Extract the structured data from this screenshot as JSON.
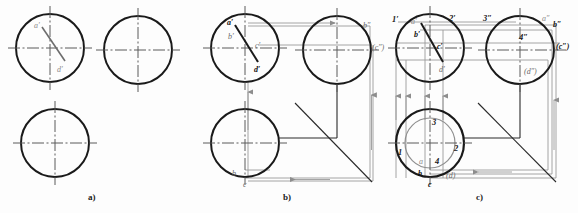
{
  "figure": {
    "background_color": "#fdfdfd",
    "outline_color": "#1a1a1a",
    "center_line_color": "#5a5a5a",
    "projection_line_color": "#9a9a9a",
    "chord_color": "#555555",
    "captions": [
      {
        "id": "a",
        "text": "a)",
        "x": 88,
        "y": 192
      },
      {
        "id": "b",
        "text": "b)",
        "x": 283,
        "y": 192
      },
      {
        "id": "c",
        "text": "c)",
        "x": 476,
        "y": 192
      }
    ]
  },
  "panel_a": {
    "name": "panel-a",
    "caption": "a)",
    "circles": [
      {
        "name": "front-view-circle",
        "cx": 50,
        "cy": 48,
        "r": 34
      },
      {
        "name": "side-view-circle",
        "cx": 138,
        "cy": 50,
        "r": 34
      },
      {
        "name": "top-view-circle",
        "cx": 55,
        "cy": 143,
        "r": 34
      }
    ],
    "labels": [
      {
        "name": "label-a-prime",
        "text": "a′",
        "x": 34,
        "y": 22
      },
      {
        "name": "label-d-prime",
        "text": "d′",
        "x": 57,
        "y": 66
      }
    ],
    "chord": {
      "name": "chord-ad",
      "x1": 42,
      "y1": 27,
      "x2": 65,
      "y2": 61
    }
  },
  "panel_b": {
    "name": "panel-b",
    "caption": "b)",
    "circles": [
      {
        "name": "front-view-circle",
        "cx": 245,
        "cy": 48,
        "r": 34
      },
      {
        "name": "side-view-circle",
        "cx": 337,
        "cy": 50,
        "r": 34
      },
      {
        "name": "top-view-circle",
        "cx": 245,
        "cy": 143,
        "r": 34
      }
    ],
    "labels": [
      {
        "name": "label-a-prime",
        "text": "a′",
        "x": 227,
        "y": 19
      },
      {
        "name": "label-b-prime",
        "text": "b′",
        "x": 228,
        "y": 33
      },
      {
        "name": "label-c-prime",
        "text": "c′",
        "x": 255,
        "y": 42
      },
      {
        "name": "label-d-prime",
        "text": "d′",
        "x": 254,
        "y": 66
      },
      {
        "name": "label-b-double-prime",
        "text": "b″",
        "x": 363,
        "y": 22
      },
      {
        "name": "label-c-double-prime",
        "text": "(c″)",
        "x": 372,
        "y": 44
      },
      {
        "name": "label-b-top",
        "text": "b",
        "x": 232,
        "y": 170
      },
      {
        "name": "label-c-top",
        "text": "c",
        "x": 243,
        "y": 181
      }
    ],
    "chord": {
      "name": "chord-ad",
      "x1": 235,
      "y1": 25,
      "x2": 258,
      "y2": 62
    },
    "miter_line": {
      "name": "miter-line-45",
      "x1": 295,
      "y1": 103,
      "x2": 372,
      "y2": 182
    }
  },
  "panel_c": {
    "name": "panel-c",
    "caption": "c)",
    "circles": [
      {
        "name": "front-view-circle",
        "cx": 430,
        "cy": 48,
        "r": 34
      },
      {
        "name": "side-view-circle",
        "cx": 520,
        "cy": 50,
        "r": 34
      },
      {
        "name": "top-view-circle",
        "cx": 430,
        "cy": 143,
        "r": 34
      },
      {
        "name": "top-view-inner-circle",
        "cx": 430,
        "cy": 143,
        "r": 25
      }
    ],
    "labels": [
      {
        "name": "label-1-prime",
        "text": "1′",
        "x": 392,
        "y": 15
      },
      {
        "name": "label-a-prime",
        "text": "a′",
        "x": 411,
        "y": 18
      },
      {
        "name": "label-2-prime",
        "text": "2′",
        "x": 449,
        "y": 14
      },
      {
        "name": "label-3-double-prime",
        "text": "3″",
        "x": 483,
        "y": 14
      },
      {
        "name": "label-a-double-prime",
        "text": "a″",
        "x": 542,
        "y": 15
      },
      {
        "name": "label-b-double-prime",
        "text": "b″",
        "x": 553,
        "y": 21
      },
      {
        "name": "label-b-prime",
        "text": "b′",
        "x": 414,
        "y": 31
      },
      {
        "name": "label-4-double-prime",
        "text": "4″",
        "x": 519,
        "y": 33
      },
      {
        "name": "label-c-prime",
        "text": "c′",
        "x": 437,
        "y": 43
      },
      {
        "name": "label-c-double-prime",
        "text": "(c″)",
        "x": 556,
        "y": 43
      },
      {
        "name": "label-d-prime",
        "text": "d′",
        "x": 439,
        "y": 66
      },
      {
        "name": "label-d-double-prime",
        "text": "(d″)",
        "x": 524,
        "y": 68
      },
      {
        "name": "label-point-3",
        "text": "3",
        "x": 432,
        "y": 118
      },
      {
        "name": "label-point-1",
        "text": "1",
        "x": 398,
        "y": 148
      },
      {
        "name": "label-point-2",
        "text": "2",
        "x": 454,
        "y": 144
      },
      {
        "name": "label-a-top",
        "text": "a",
        "x": 419,
        "y": 158
      },
      {
        "name": "label-point-4",
        "text": "4",
        "x": 435,
        "y": 157
      },
      {
        "name": "label-b-top",
        "text": "b",
        "x": 418,
        "y": 170
      },
      {
        "name": "label-c-top",
        "text": "c",
        "x": 428,
        "y": 181
      },
      {
        "name": "label-d-top",
        "text": "(d)",
        "x": 446,
        "y": 172
      }
    ],
    "chord": {
      "name": "chord-ad",
      "x1": 421,
      "y1": 23,
      "x2": 443,
      "y2": 62
    },
    "miter_line": {
      "name": "miter-line-45",
      "x1": 478,
      "y1": 103,
      "x2": 556,
      "y2": 182
    }
  }
}
